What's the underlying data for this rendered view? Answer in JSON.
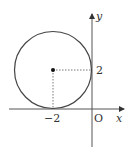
{
  "diagram": {
    "axes": {
      "x_label": "x",
      "y_label": "y",
      "origin_label": "O"
    },
    "circle": {
      "center": [
        -2,
        2
      ],
      "radius": 2
    },
    "tick_labels": {
      "x_tick": "−2",
      "y_tick": "2"
    },
    "colors": {
      "stroke": "#444444",
      "axis": "#444444",
      "dashed": "#555555"
    }
  }
}
